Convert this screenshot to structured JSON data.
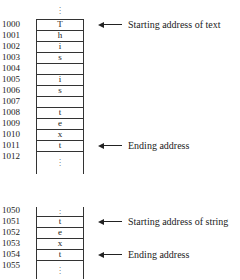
{
  "top_block": {
    "rows": [
      {
        "address": "1000",
        "value": "T"
      },
      {
        "address": "1001",
        "value": "h"
      },
      {
        "address": "1002",
        "value": "i"
      },
      {
        "address": "1003",
        "value": "s"
      },
      {
        "address": "1004",
        "value": ""
      },
      {
        "address": "1005",
        "value": "i"
      },
      {
        "address": "1006",
        "value": "s"
      },
      {
        "address": "1007",
        "value": ""
      },
      {
        "address": "1008",
        "value": "t"
      },
      {
        "address": "1009",
        "value": "e"
      },
      {
        "address": "1010",
        "value": "x"
      },
      {
        "address": "1011",
        "value": "t"
      },
      {
        "address": "1012",
        "value": ""
      }
    ],
    "labels": {
      "start": "Starting address of text",
      "end": "Ending address"
    }
  },
  "bottom_block": {
    "rows": [
      {
        "address": "1050",
        "value": ""
      },
      {
        "address": "1051",
        "value": "t"
      },
      {
        "address": "1052",
        "value": "e"
      },
      {
        "address": "1053",
        "value": "x"
      },
      {
        "address": "1054",
        "value": "t"
      },
      {
        "address": "1055",
        "value": ""
      }
    ],
    "labels": {
      "start": "Starting address of string",
      "end": "Ending address"
    }
  },
  "ellipsis": "⋮"
}
